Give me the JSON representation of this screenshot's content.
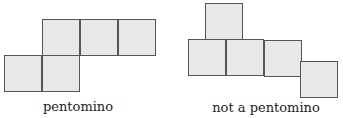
{
  "figures": [
    {
      "label": "pentomino",
      "squares": [
        {
          "x": 42,
          "y": 19
        },
        {
          "x": 80,
          "y": 19
        },
        {
          "x": 118,
          "y": 19
        },
        {
          "x": 4,
          "y": 55
        },
        {
          "x": 42,
          "y": 55
        }
      ],
      "label_pos": {
        "x": 78,
        "y": 100
      }
    },
    {
      "label": "not a pentomino",
      "squares": [
        {
          "x": 205,
          "y": 3
        },
        {
          "x": 188,
          "y": 39
        },
        {
          "x": 226,
          "y": 39
        },
        {
          "x": 264,
          "y": 40
        },
        {
          "x": 300,
          "y": 61
        }
      ],
      "label_pos": {
        "x": 266,
        "y": 101
      }
    }
  ],
  "colors": {
    "square_fill": "#e8e8e8",
    "square_border": "#555555",
    "text": "#222222"
  }
}
